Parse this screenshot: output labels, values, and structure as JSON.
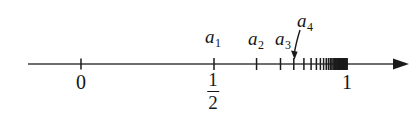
{
  "figure": {
    "ink_color": "#141414",
    "axis_color": "#3c3c3c",
    "background": "#ffffff"
  },
  "axis": {
    "line_start_x": 28,
    "line_end_x": 408,
    "line_y": 64,
    "arrow_direction": "right",
    "endpoints": [
      {
        "name": "zero-label",
        "text": "0",
        "x": 81
      },
      {
        "name": "one-label",
        "text": "1",
        "x": 347
      }
    ],
    "half_label": {
      "numerator": "1",
      "denominator": "2",
      "x": 213
    }
  },
  "terms": [
    {
      "name": "a1",
      "base": "a",
      "subscript": "1",
      "label_x": 213,
      "label_y": 27,
      "tick_x": 213
    },
    {
      "name": "a2",
      "base": "a",
      "subscript": "2",
      "label_x": 256,
      "label_y": 29,
      "tick_x": 257
    },
    {
      "name": "a3",
      "base": "a",
      "subscript": "3",
      "label_x": 283,
      "label_y": 29,
      "tick_x": 281
    },
    {
      "name": "a4",
      "base": "a",
      "subscript": "4",
      "label_x": 305,
      "label_y": 11,
      "tick_x": 295
    }
  ],
  "pointer": {
    "name": "a4-pointer-arrow",
    "from_x": 300,
    "from_y": 30,
    "to_x": 294,
    "to_y": 55
  },
  "chart_data": {
    "type": "scatter",
    "xlabel": "",
    "ylabel": "",
    "xlim": [
      0,
      1.12
    ],
    "grid": false,
    "legend": false,
    "axis_ticks": [
      {
        "value": 0,
        "label": "0"
      },
      {
        "value": 0.5,
        "label": "1/2"
      },
      {
        "value": 1,
        "label": "1"
      }
    ],
    "annotations": [
      "a_1",
      "a_2",
      "a_3",
      "a_4"
    ],
    "series": [
      {
        "name": "a_n = 1 - 1/2^n",
        "labelled_terms": [
          "a_1",
          "a_2",
          "a_3",
          "a_4"
        ],
        "values": [
          0.5,
          0.66,
          0.75,
          0.8,
          0.838,
          0.865,
          0.885,
          0.9,
          0.912,
          0.922,
          0.93,
          0.937,
          0.943,
          0.948,
          0.952,
          0.956,
          0.959,
          0.962,
          0.965,
          0.968,
          0.97,
          0.972,
          0.974,
          0.976,
          0.978,
          0.98,
          0.981,
          0.982,
          0.983,
          0.984,
          0.985,
          0.986,
          0.987,
          0.988,
          0.989,
          0.99,
          0.991,
          0.992,
          0.993,
          0.994,
          0.995,
          0.996,
          0.997,
          0.998,
          0.999
        ],
        "limit": 1
      }
    ]
  }
}
